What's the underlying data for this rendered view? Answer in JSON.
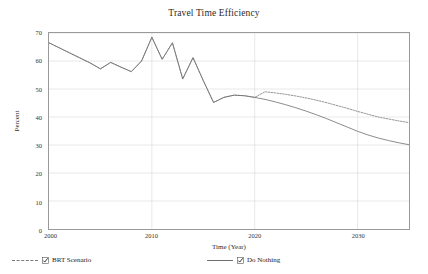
{
  "chart_data": {
    "type": "line",
    "title": "Travel Time Efficiency",
    "xlabel": "Time (Year)",
    "ylabel": "Percent",
    "xlim": [
      2000,
      2035
    ],
    "ylim": [
      0,
      70
    ],
    "xticks": [
      "2000",
      "2010",
      "2020",
      "2030"
    ],
    "xtick_values": [
      2000,
      2010,
      2020,
      2030
    ],
    "yticks": [
      "0",
      "10",
      "20",
      "30",
      "40",
      "50",
      "60",
      "70"
    ],
    "ytick_values": [
      0,
      10,
      20,
      30,
      40,
      50,
      60,
      70
    ],
    "grid": true,
    "legend_position": "bottom",
    "x": [
      2000,
      2001,
      2002,
      2003,
      2004,
      2005,
      2006,
      2007,
      2008,
      2009,
      2010,
      2011,
      2012,
      2013,
      2014,
      2015,
      2016,
      2017,
      2018,
      2019,
      2020,
      2021,
      2022,
      2023,
      2024,
      2025,
      2026,
      2027,
      2028,
      2029,
      2030,
      2031,
      2032,
      2033,
      2034,
      2035
    ],
    "series": [
      {
        "name": "BRT Scenario",
        "style": "dashed",
        "color": "#7a7a7a",
        "values": [
          66.5,
          64.7,
          62.9,
          61.1,
          59.3,
          57.2,
          59.5,
          57.8,
          56.2,
          60.0,
          68.5,
          60.6,
          66.5,
          53.6,
          61.2,
          53.0,
          45.2,
          47.0,
          47.8,
          47.6,
          47.0,
          49.0,
          48.6,
          48.1,
          47.5,
          46.8,
          46.0,
          45.1,
          44.1,
          43.1,
          42.0,
          41.0,
          40.0,
          39.3,
          38.6,
          38.0
        ]
      },
      {
        "name": "Do Nothing",
        "style": "solid",
        "color": "#6e6e6e",
        "values": [
          66.5,
          64.7,
          62.9,
          61.1,
          59.3,
          57.2,
          59.5,
          57.8,
          56.2,
          60.0,
          68.5,
          60.6,
          66.5,
          53.6,
          61.2,
          53.0,
          45.2,
          47.0,
          47.8,
          47.6,
          47.0,
          46.3,
          45.4,
          44.4,
          43.3,
          42.1,
          40.8,
          39.4,
          37.9,
          36.4,
          34.9,
          33.6,
          32.5,
          31.6,
          30.8,
          30.1
        ]
      }
    ]
  },
  "legend": {
    "items": [
      {
        "label": "BRT Scenario",
        "checked": true,
        "style": "dashed",
        "checkbox_icon": "checkbox-checked-icon"
      },
      {
        "label": "Do Nothing",
        "checked": true,
        "style": "solid",
        "checkbox_icon": "checkbox-checked-icon"
      }
    ]
  }
}
